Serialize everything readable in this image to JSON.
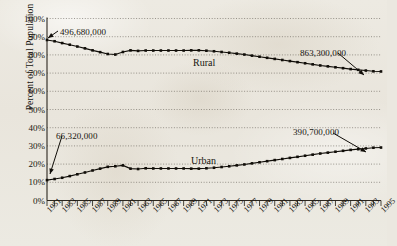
{
  "chart_data": {
    "type": "line",
    "title": "",
    "xlabel": "",
    "ylabel": "Percent of Total Population",
    "ylim": [
      0,
      100
    ],
    "ytick_labels": [
      "100%",
      "90%",
      "80%",
      "70%",
      "60%",
      "50%",
      "40%",
      "30%",
      "20%",
      "10%",
      "0%"
    ],
    "ytick_values": [
      100,
      90,
      80,
      70,
      60,
      50,
      40,
      30,
      20,
      10,
      0
    ],
    "grid": true,
    "legend_position": "inline-labels",
    "x": [
      1951,
      1952,
      1953,
      1954,
      1955,
      1956,
      1957,
      1958,
      1959,
      1960,
      1961,
      1962,
      1963,
      1964,
      1965,
      1966,
      1967,
      1968,
      1969,
      1970,
      1971,
      1972,
      1973,
      1974,
      1975,
      1976,
      1977,
      1978,
      1979,
      1980,
      1981,
      1982,
      1983,
      1984,
      1985,
      1986,
      1987,
      1988,
      1989,
      1990,
      1991,
      1992,
      1993,
      1994,
      1995
    ],
    "xtick_labels": [
      "1951",
      "1953",
      "1955",
      "1957",
      "1959",
      "1961",
      "1963",
      "1965",
      "1967",
      "1969",
      "1971",
      "1973",
      "1975",
      "1977",
      "1979",
      "1981",
      "1983",
      "1985",
      "1987",
      "1989",
      "1991",
      "1993",
      "1995"
    ],
    "series": [
      {
        "name": "Rural",
        "values": [
          88.2,
          87.5,
          86.5,
          85.6,
          84.6,
          83.6,
          82.5,
          81.5,
          80.5,
          80.2,
          81.6,
          82.5,
          82.2,
          82.4,
          82.4,
          82.4,
          82.4,
          82.4,
          82.4,
          82.5,
          82.5,
          82.3,
          82.0,
          81.6,
          81.2,
          80.7,
          80.2,
          79.6,
          79.0,
          78.4,
          77.8,
          77.2,
          76.6,
          76.0,
          75.4,
          74.8,
          74.2,
          73.7,
          73.2,
          72.7,
          72.2,
          71.8,
          71.4,
          71.0,
          70.9
        ]
      },
      {
        "name": "Urban",
        "values": [
          11.2,
          11.8,
          12.5,
          13.4,
          14.4,
          15.4,
          16.5,
          17.5,
          18.5,
          18.8,
          19.3,
          17.5,
          17.3,
          17.7,
          17.6,
          17.6,
          17.6,
          17.6,
          17.6,
          17.5,
          17.5,
          17.7,
          18.0,
          18.4,
          18.8,
          19.3,
          19.8,
          20.4,
          21.0,
          21.6,
          22.2,
          22.8,
          23.4,
          24.0,
          24.6,
          25.2,
          25.8,
          26.3,
          26.8,
          27.3,
          27.8,
          28.2,
          28.6,
          29.0,
          29.1
        ]
      }
    ],
    "annotations": [
      {
        "text": "496,680,000",
        "series": "Rural",
        "point_year": 1951,
        "label_x": 60,
        "label_y": 27,
        "arrow_from": [
          58,
          31
        ],
        "arrow_to": [
          48,
          38
        ]
      },
      {
        "text": "863,300,000",
        "series": "Rural",
        "point_year": 1995,
        "label_x": 300,
        "label_y": 48,
        "arrow_from": [
          338,
          53
        ],
        "arrow_to": [
          364,
          75
        ]
      },
      {
        "text": "66,320,000",
        "series": "Urban",
        "point_year": 1951,
        "label_x": 56,
        "label_y": 131,
        "arrow_from": [
          62,
          136
        ],
        "arrow_to": [
          50,
          174
        ]
      },
      {
        "text": "390,700,000",
        "series": "Urban",
        "point_year": 1995,
        "label_x": 293,
        "label_y": 127,
        "arrow_from": [
          333,
          133
        ],
        "arrow_to": [
          366,
          152
        ]
      }
    ],
    "series_labels": [
      {
        "text": "Rural",
        "x": 193,
        "y": 57
      },
      {
        "text": "Urban",
        "x": 191,
        "y": 155
      }
    ]
  }
}
